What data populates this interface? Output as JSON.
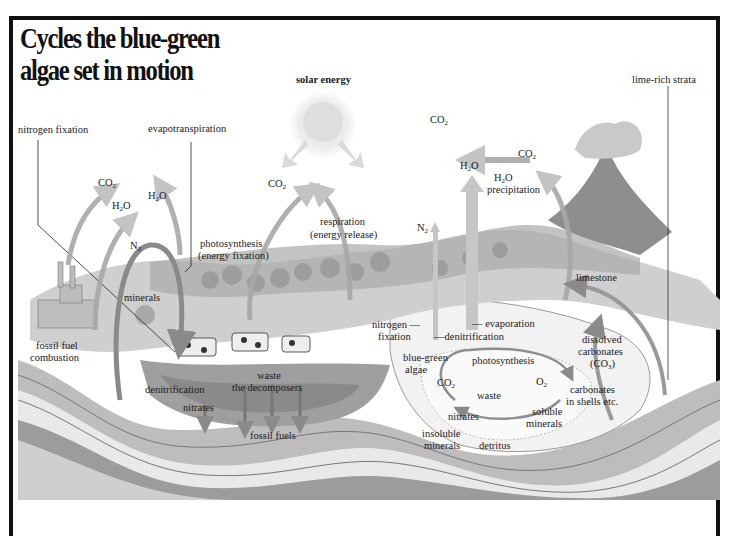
{
  "title": {
    "line1": "Cycles the blue-green",
    "line2": "algae set in motion"
  },
  "labels": {
    "solar_energy": "solar energy",
    "lime_rich_strata": "lime-rich strata",
    "nitrogen_fixation_top": "nitrogen fixation",
    "evapotranspiration": "evapotranspiration",
    "co2_volcano_left": "CO",
    "co2_volcano_right": "CO",
    "co2_left": "CO",
    "h2o_left": "H",
    "h2o_mid": "H",
    "co2_center": "CO",
    "h2o_rising": "H",
    "h2o_precip": "H",
    "precipitation": "precipitation",
    "n2_left": "N",
    "n2_right": "N",
    "photosynthesis_land": "photosynthesis",
    "energy_fixation": "(energy fixation)",
    "respiration": "respiration",
    "energy_release": "(energy release)",
    "minerals": "minerals",
    "fossil_fuel": "fossil fuel",
    "combustion": "combustion",
    "denitrification_land": "denitrification",
    "nitrates_land": "nitrates",
    "waste_land": "waste",
    "the_decomposers": "the decomposers",
    "fossil_fuels": "fossil fuels",
    "nitrogen_water": "nitrogen —",
    "fixation_water": "fixation",
    "denitrification_water": "—denitrification",
    "evaporation": "— evaporation",
    "blue_green": "blue-green",
    "algae": "algae",
    "photosynthesis_water": "photosynthesis",
    "co2_water": "CO",
    "o2_water": "O",
    "waste_water": "waste",
    "nitrates_water": "nitrates",
    "soluble": "soluble",
    "soluble_minerals": "minerals",
    "insoluble": "insoluble",
    "insoluble_minerals": "minerals",
    "detritus": "detritus",
    "limestone": "limestone",
    "dissolved": "dissolved",
    "carbonates": "carbonates",
    "co3": "(CO",
    "carbonates2": "carbonates",
    "in_shells": "in shells etc."
  },
  "colors": {
    "frame": "#111111",
    "arrow": "#9a9a9a",
    "land": "#c8c8c8",
    "water": "#e8e8e8",
    "strata_dark": "#8e8e8e",
    "strata_light": "#eeeeee"
  }
}
